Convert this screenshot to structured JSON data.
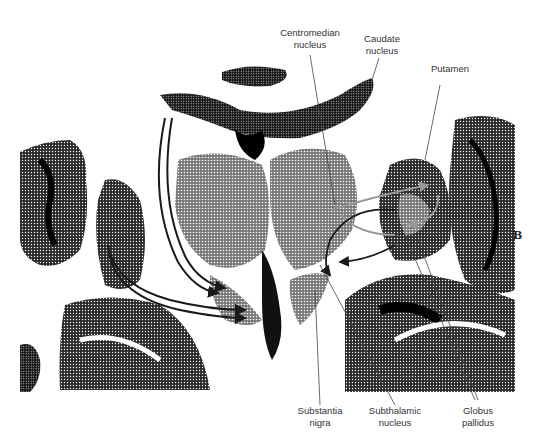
{
  "figure": {
    "panel_letter": "B"
  },
  "labels": {
    "centromedian": {
      "line1": "Centromedian",
      "line2": "nucleus"
    },
    "caudate": {
      "line1": "Caudate",
      "line2": "nucleus"
    },
    "putamen": {
      "line1": "Putamen"
    },
    "substantia_nigra": {
      "line1": "Substantia",
      "line2": "nigra"
    },
    "subthalamic": {
      "line1": "Subthalamic",
      "line2": "nucleus"
    },
    "globus_pallidus": {
      "line1": "Globus",
      "line2": "pallidus"
    }
  },
  "colors": {
    "tissue_dark": "#111111",
    "tissue_mid": "#555555",
    "background": "#ffffff",
    "label_text": "#333333",
    "leader_line": "#444444",
    "arrow_dark": "#1a1a1a",
    "arrow_gray": "#999999"
  }
}
